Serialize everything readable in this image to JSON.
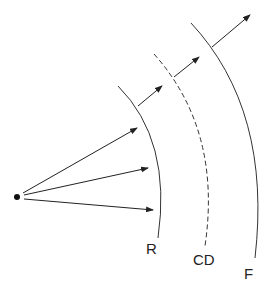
{
  "diagram": {
    "type": "wavefront-propagation",
    "source": {
      "x": 17,
      "y": 197,
      "label": ""
    },
    "source_rays": [
      {
        "to_x": 137,
        "to_y": 128
      },
      {
        "to_x": 148,
        "to_y": 168
      },
      {
        "to_x": 153,
        "to_y": 210
      }
    ],
    "fronts": [
      {
        "id": "R",
        "label": "R",
        "style": "solid"
      },
      {
        "id": "CD",
        "label": "CD",
        "style": "dashed"
      },
      {
        "id": "F",
        "label": "F",
        "style": "solid"
      }
    ],
    "colors": {
      "stroke": "#333333",
      "background": "#ffffff"
    }
  }
}
